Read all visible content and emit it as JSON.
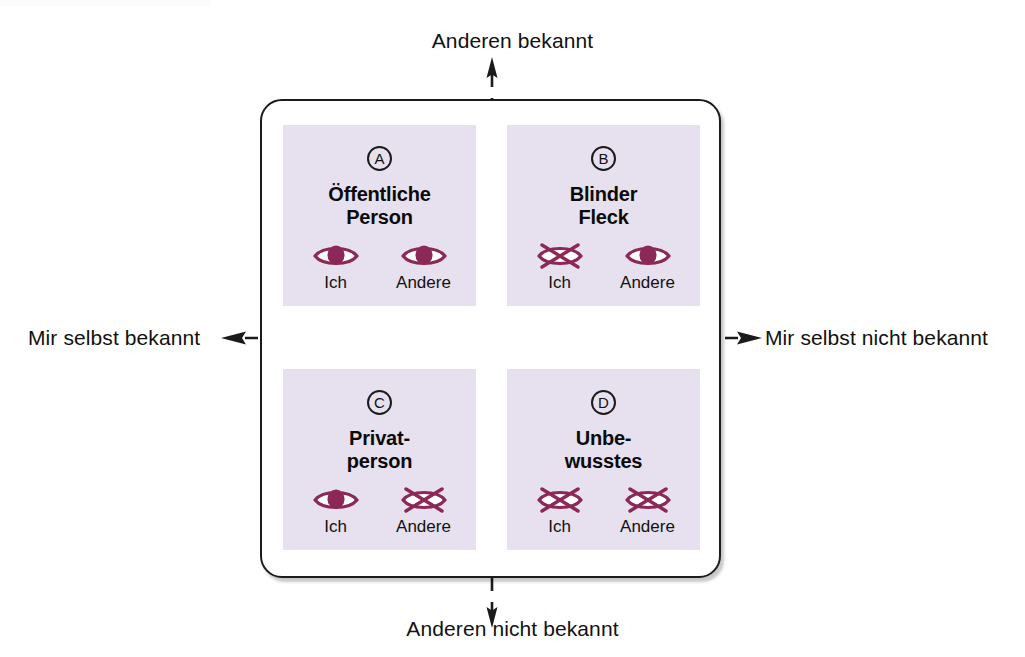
{
  "diagram": {
    "frame": {
      "shape": "rounded-rectangle"
    },
    "axes": {
      "top_label": "Anderen bekannt",
      "bottom_label": "Anderen nicht bekannt",
      "left_label": "Mir selbst bekannt",
      "right_label": "Mir selbst nicht bekannt",
      "line_style": "dashed",
      "line_color": "#1b1b1b"
    },
    "colors": {
      "quadrant_background": "#e7e0ee",
      "icon_color": "#8b2857",
      "text_color": "#111111",
      "frame_border": "#1b1b1b",
      "page_background": "#ffffff"
    },
    "quadrants": [
      {
        "letter": "A",
        "title": "Öffentliche\nPerson",
        "title_line1": "Öffentliche",
        "title_line2": "Person",
        "icons": [
          {
            "caption": "Ich",
            "state": "open-eye"
          },
          {
            "caption": "Andere",
            "state": "open-eye"
          }
        ]
      },
      {
        "letter": "B",
        "title": "Blinder\nFleck",
        "title_line1": "Blinder",
        "title_line2": "Fleck",
        "icons": [
          {
            "caption": "Ich",
            "state": "crossed-eye"
          },
          {
            "caption": "Andere",
            "state": "open-eye"
          }
        ]
      },
      {
        "letter": "C",
        "title": "Privat-\nperson",
        "title_line1": "Privat-",
        "title_line2": "person",
        "icons": [
          {
            "caption": "Ich",
            "state": "open-eye"
          },
          {
            "caption": "Andere",
            "state": "crossed-eye"
          }
        ]
      },
      {
        "letter": "D",
        "title": "Unbe-\nwusstes",
        "title_line1": "Unbe-",
        "title_line2": "wusstes",
        "icons": [
          {
            "caption": "Ich",
            "state": "crossed-eye"
          },
          {
            "caption": "Andere",
            "state": "crossed-eye"
          }
        ]
      }
    ]
  }
}
